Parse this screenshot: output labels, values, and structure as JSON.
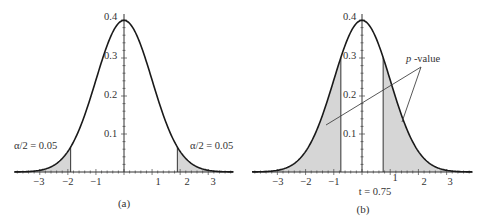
{
  "chart_data": [
    {
      "id": "a",
      "type": "area",
      "caption": "(a)",
      "title": "",
      "xlabel": "",
      "ylabel": "",
      "distribution": "t / standard normal-like density",
      "xlim": [
        -3.9,
        3.9
      ],
      "ylim": [
        0,
        0.4
      ],
      "x_ticks": [
        "-3",
        "-2",
        "-1",
        "1",
        "2",
        "3"
      ],
      "y_ticks": [
        "0.1",
        "0.2",
        "0.3",
        "0.4"
      ],
      "shaded_regions": [
        {
          "from": -3.9,
          "to": -1.9,
          "label": "α/2 = 0.05"
        },
        {
          "from": 1.9,
          "to": 3.9,
          "label": "α/2 = 0.05"
        }
      ],
      "critical_values": [
        -1.9,
        1.9
      ],
      "annotations": [
        "α/2 = 0.05",
        "α/2 = 0.05"
      ],
      "peak_value": 0.39
    },
    {
      "id": "b",
      "type": "area",
      "caption": "(b)",
      "title": "",
      "xlabel": "",
      "ylabel": "",
      "xlim": [
        -3.9,
        3.9
      ],
      "ylim": [
        0,
        0.4
      ],
      "x_ticks": [
        "-3",
        "-2",
        "-1",
        "1",
        "2",
        "3"
      ],
      "y_ticks": [
        "0.1",
        "0.2",
        "0.3",
        "0.4"
      ],
      "shaded_regions": [
        {
          "from": -3.9,
          "to": -0.75
        },
        {
          "from": 0.75,
          "to": 3.9
        }
      ],
      "test_statistic": {
        "label": "t = 0.75",
        "value": 0.75
      },
      "annotations": [
        "p -value",
        "t = 0.75"
      ],
      "peak_value": 0.39
    }
  ],
  "labels": {
    "a_caption": "(a)",
    "b_caption": "(b)",
    "a_left_tail": "α/2 = 0.05",
    "a_right_tail": "α/2 = 0.05",
    "b_pvalue_p": "p",
    "b_pvalue_rest": " -value",
    "b_tstat": "t = 0.75",
    "y_ticks": [
      "0.1",
      "0.2",
      "0.3",
      "0.4"
    ],
    "x_ticks": [
      "−3",
      "−2",
      "−1",
      "1",
      "2",
      "3"
    ]
  }
}
